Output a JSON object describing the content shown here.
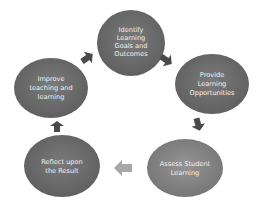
{
  "diagram": {
    "type": "cycle",
    "colors": {
      "node_fill": "#6b6b6b",
      "node_fill_light": "#8a8a8a",
      "arrow_fill": "#4a4a4a",
      "arrow_light": "#a8a8a8",
      "text": "#f2f2f2",
      "background": "#ffffff"
    },
    "nodes": [
      {
        "id": "identify",
        "lines": [
          "Identify",
          "Learning",
          "Goals and",
          "Outcomes"
        ]
      },
      {
        "id": "provide",
        "lines": [
          "Provide",
          "Learning",
          "Opportunities"
        ]
      },
      {
        "id": "assess",
        "lines": [
          "Assess Student",
          "Learning"
        ]
      },
      {
        "id": "reflect",
        "lines": [
          "Reflect upon",
          "the Result"
        ]
      },
      {
        "id": "improve",
        "lines": [
          "Improve",
          "teaching and",
          "learning"
        ]
      }
    ],
    "edges": [
      {
        "from": "identify",
        "to": "provide"
      },
      {
        "from": "provide",
        "to": "assess"
      },
      {
        "from": "assess",
        "to": "reflect"
      },
      {
        "from": "reflect",
        "to": "improve"
      },
      {
        "from": "improve",
        "to": "identify"
      }
    ]
  }
}
